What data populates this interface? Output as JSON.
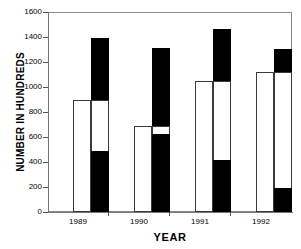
{
  "chart_data": {
    "type": "bar",
    "title": "",
    "xlabel": "YEAR",
    "ylabel": "NUMBER IN HUNDREDS",
    "categories": [
      "1989",
      "1990",
      "1991",
      "1992"
    ],
    "ylim": [
      0,
      1600
    ],
    "y_ticks": [
      0,
      200,
      400,
      600,
      800,
      1000,
      1200,
      1400,
      1600
    ],
    "y_tick_labels": [
      "0",
      "200",
      "400",
      "600",
      "800",
      "1000",
      "1200",
      "1400",
      "1600"
    ],
    "grid": false,
    "legend": "none",
    "series": [
      {
        "name": "white-series",
        "color": "#ffffff",
        "edge_color": "#3a3a3a",
        "values": [
          900,
          690,
          1050,
          1120
        ]
      },
      {
        "name": "black-series",
        "color": "#000000",
        "edge_color": "#000000",
        "values": [
          1390,
          1310,
          1465,
          1305
        ]
      }
    ],
    "black_series_notch_base": [
      490,
      625,
      415,
      190
    ]
  },
  "axes": {
    "y_title": "NUMBER IN HUNDREDS",
    "x_title": "YEAR"
  },
  "y_labels": {
    "t0": "0",
    "t1": "200",
    "t2": "400",
    "t3": "600",
    "t4": "800",
    "t5": "1000",
    "t6": "1200",
    "t7": "1400",
    "t8": "1600"
  },
  "x_labels": {
    "g0": "1989",
    "g1": "1990",
    "g2": "1991",
    "g3": "1992"
  },
  "colors": {
    "bar_white_fill": "#ffffff",
    "bar_white_edge": "#3a3a3a",
    "bar_black_fill": "#000000",
    "axis": "#777777",
    "text": "#000000"
  }
}
